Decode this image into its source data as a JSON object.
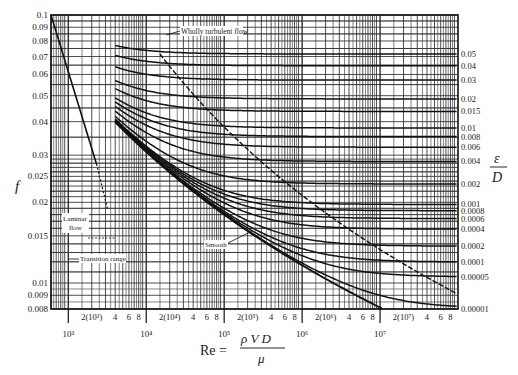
{
  "chart_data": {
    "type": "line",
    "xlabel": "Re = ρVD/μ",
    "ylabel": "f",
    "right_ylabel": "ε/D",
    "xscale": "log",
    "yscale": "log",
    "xlim": [
      600,
      100000000
    ],
    "ylim": [
      0.008,
      0.1
    ],
    "grid": true,
    "y_ticks": [
      "0.1",
      "0.09",
      "0.08",
      "0.07",
      "0.06",
      "0.05",
      "0.04",
      "0.03",
      "0.025",
      "0.02",
      "0.015",
      "0.01",
      "0.009",
      "0.008"
    ],
    "x_major_ticks": [
      "10^3",
      "10^4",
      "10^5",
      "10^6",
      "10^7"
    ],
    "x_minor_labels": [
      "2(10^3)",
      "4",
      "6",
      "8",
      "2(10^4)",
      "4",
      "6",
      "8",
      "2(10^5)",
      "4",
      "6",
      "8",
      "2(10^6)",
      "4",
      "6",
      "8",
      "2(10^7)",
      "4",
      "6",
      "8"
    ],
    "relative_roughness_labels": [
      "0.05",
      "0.04",
      "0.03",
      "0.02",
      "0.015",
      "0.01",
      "0.008",
      "0.006",
      "0.004",
      "0.002",
      "0.001",
      "0.0008",
      "0.0006",
      "0.0004",
      "0.0002",
      "0.0001",
      "0.00005",
      "0.00001"
    ],
    "annotations": [
      "Wholly turbulent flow",
      "Laminar flow",
      "Transition range",
      "Smooth"
    ],
    "series": [
      {
        "name": "Laminar (f = 64/Re)",
        "x": [
          600,
          1000,
          2000,
          2300
        ],
        "y": [
          0.1067,
          0.064,
          0.032,
          0.0278
        ]
      },
      {
        "name": "ε/D = 0.05",
        "fully_rough_f": 0.0716
      },
      {
        "name": "ε/D = 0.04",
        "fully_rough_f": 0.0649
      },
      {
        "name": "ε/D = 0.03",
        "fully_rough_f": 0.0571
      },
      {
        "name": "ε/D = 0.02",
        "fully_rough_f": 0.0491
      },
      {
        "name": "ε/D = 0.015",
        "fully_rough_f": 0.0438
      },
      {
        "name": "ε/D = 0.01",
        "fully_rough_f": 0.038
      },
      {
        "name": "ε/D = 0.008",
        "fully_rough_f": 0.0353
      },
      {
        "name": "ε/D = 0.006",
        "fully_rough_f": 0.0321
      },
      {
        "name": "ε/D = 0.004",
        "fully_rough_f": 0.0284
      },
      {
        "name": "ε/D = 0.002",
        "fully_rough_f": 0.0234
      },
      {
        "name": "ε/D = 0.001",
        "fully_rough_f": 0.0196
      },
      {
        "name": "ε/D = 0.0008",
        "fully_rough_f": 0.0187
      },
      {
        "name": "ε/D = 0.0006",
        "fully_rough_f": 0.0177
      },
      {
        "name": "ε/D = 0.0004",
        "fully_rough_f": 0.0163
      },
      {
        "name": "ε/D = 0.0002",
        "fully_rough_f": 0.0137
      },
      {
        "name": "ε/D = 0.0001",
        "fully_rough_f": 0.012
      },
      {
        "name": "ε/D = 0.00005",
        "fully_rough_f": 0.0106
      },
      {
        "name": "ε/D = 0.00001",
        "fully_rough_f": 0.008
      },
      {
        "name": "Smooth",
        "x": [
          4000,
          10000,
          100000,
          1000000,
          10000000
        ],
        "y": [
          0.0399,
          0.0309,
          0.018,
          0.0116,
          0.0081
        ]
      }
    ]
  },
  "labels": {
    "f": "f",
    "eps": "ε",
    "D": "D",
    "re_lhs": "Re =",
    "re_num": "ρ V D",
    "re_den": "μ",
    "wholly_turbulent": "Wholly turbulent flow",
    "laminar_1": "Laminar",
    "laminar_2": "flow",
    "transition": "Transition range",
    "smooth": "Smooth"
  }
}
